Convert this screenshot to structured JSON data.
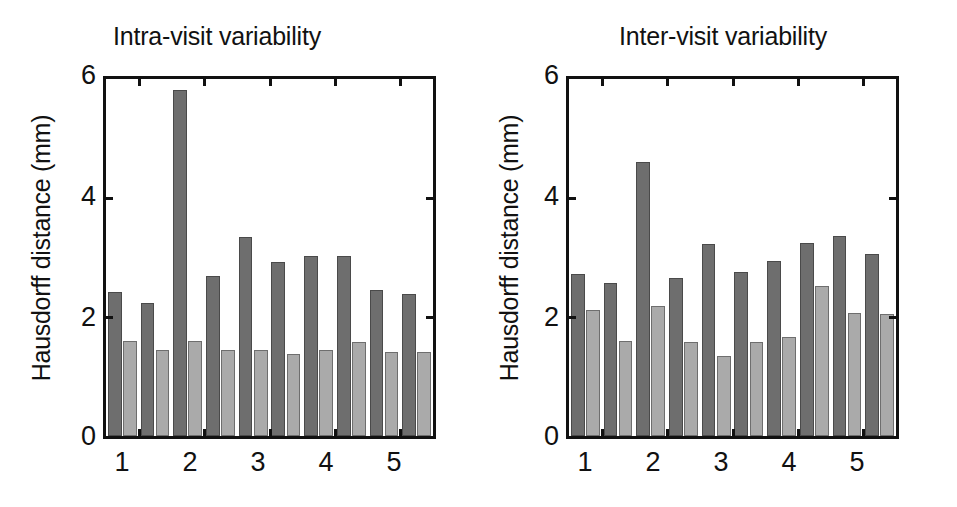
{
  "figure": {
    "ylabel": "Hausdorff distance (mm)",
    "colors": {
      "dark_series": "#6e6e6e",
      "light_series": "#aaaaaa",
      "axis": "#111111",
      "background": "#ffffff"
    }
  },
  "panels": [
    {
      "id": "intra-visit",
      "title": "Intra-visit variability",
      "ylabel": "Hausdorff distance (mm)",
      "ytick_labels": [
        "6",
        "4",
        "2",
        "0"
      ],
      "xtick_labels": [
        "1",
        "2",
        "3",
        "4",
        "5"
      ]
    },
    {
      "id": "inter-visit",
      "title": "Inter-visit variability",
      "ylabel": "Hausdorff distance (mm)",
      "ytick_labels": [
        "6",
        "4",
        "2",
        "0"
      ],
      "xtick_labels": [
        "1",
        "2",
        "3",
        "4",
        "5"
      ]
    }
  ],
  "chart_data": [
    {
      "type": "bar",
      "title": "Intra-visit variability",
      "xlabel": "",
      "ylabel": "Hausdorff distance (mm)",
      "ylim": [
        0,
        6
      ],
      "yticks": [
        0,
        2,
        4,
        6
      ],
      "xticks": [
        1,
        2,
        3,
        4,
        5
      ],
      "xtick_labels": [
        "1",
        "2",
        "3",
        "4",
        "5"
      ],
      "grid": false,
      "legend": "none",
      "categories": [
        "1a",
        "1b",
        "2a",
        "2b",
        "3a",
        "3b",
        "4a",
        "4b",
        "5a",
        "5b"
      ],
      "series": [
        {
          "name": "dark",
          "color": "#6e6e6e",
          "values": [
            2.42,
            2.24,
            5.82,
            2.69,
            3.35,
            2.92,
            3.02,
            3.03,
            2.45,
            2.38
          ]
        },
        {
          "name": "light",
          "color": "#aaaaaa",
          "values": [
            1.6,
            1.44,
            1.6,
            1.44,
            1.44,
            1.38,
            1.44,
            1.58,
            1.42,
            1.42
          ]
        }
      ]
    },
    {
      "type": "bar",
      "title": "Inter-visit variability",
      "xlabel": "",
      "ylabel": "Hausdorff distance (mm)",
      "ylim": [
        0,
        6
      ],
      "yticks": [
        0,
        2,
        4,
        6
      ],
      "xticks": [
        1,
        2,
        3,
        4,
        5
      ],
      "xtick_labels": [
        "1",
        "2",
        "3",
        "4",
        "5"
      ],
      "grid": false,
      "legend": "none",
      "categories": [
        "1a",
        "1b",
        "2a",
        "2b",
        "3a",
        "3b",
        "4a",
        "4b",
        "5a",
        "5b"
      ],
      "series": [
        {
          "name": "dark",
          "color": "#6e6e6e",
          "values": [
            2.72,
            2.58,
            4.6,
            2.66,
            3.22,
            2.76,
            2.94,
            3.24,
            3.36,
            3.06
          ]
        },
        {
          "name": "light",
          "color": "#aaaaaa",
          "values": [
            2.12,
            1.6,
            2.18,
            1.58,
            1.34,
            1.58,
            1.66,
            2.52,
            2.06,
            2.05
          ]
        }
      ]
    }
  ]
}
